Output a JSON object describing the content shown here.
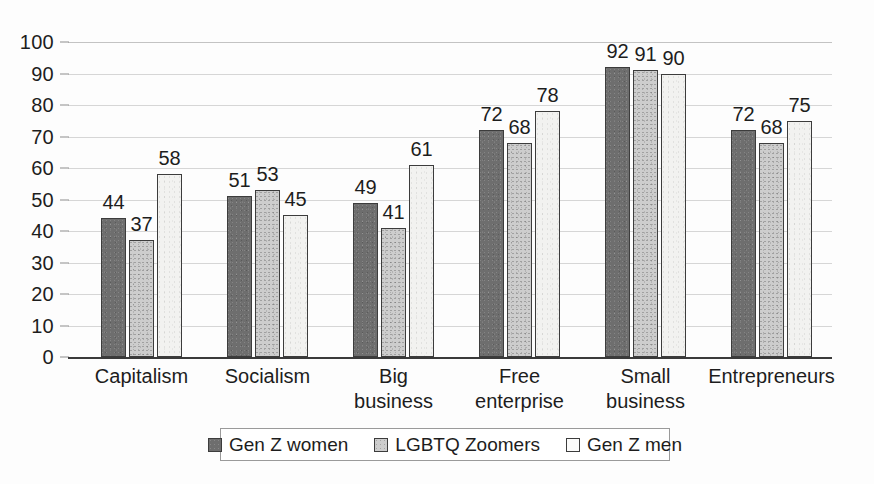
{
  "chart_data": {
    "type": "bar",
    "title": "",
    "subtitle": "",
    "xlabel": "",
    "ylabel": "",
    "ylim": [
      0,
      100
    ],
    "ytick_values": [
      0,
      10,
      20,
      30,
      40,
      50,
      60,
      70,
      80,
      90,
      100
    ],
    "ytick_labels": [
      "0",
      "10",
      "20",
      "30",
      "40",
      "50",
      "60",
      "70",
      "80",
      "90",
      "100"
    ],
    "grid": true,
    "legend_position": "bottom",
    "categories": [
      "Capitalism",
      "Socialism",
      "Big\nbusiness",
      "Free\nenterprise",
      "Small\nbusiness",
      "Entrepreneurs"
    ],
    "series": [
      {
        "name": "Gen Z women",
        "color": "#6e6e6e",
        "values": [
          44,
          51,
          49,
          72,
          92,
          72
        ],
        "value_labels": [
          "44",
          "51",
          "49",
          "72",
          "92",
          "72"
        ]
      },
      {
        "name": "LGBTQ Zoomers",
        "color": "#cdcdcd",
        "values": [
          37,
          53,
          41,
          68,
          91,
          68
        ],
        "value_labels": [
          "37",
          "53",
          "41",
          "68",
          "91",
          "68"
        ]
      },
      {
        "name": "Gen Z men",
        "color": "#f2f2f0",
        "values": [
          58,
          45,
          61,
          78,
          90,
          75
        ],
        "value_labels": [
          "58",
          "45",
          "61",
          "78",
          "90",
          "75"
        ]
      }
    ]
  },
  "legend": {
    "entries": [
      {
        "label": "Gen Z women"
      },
      {
        "label": "LGBTQ Zoomers"
      },
      {
        "label": "Gen Z men"
      }
    ]
  }
}
